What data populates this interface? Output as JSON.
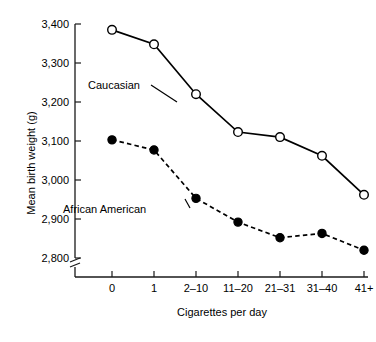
{
  "chart_data": {
    "type": "line",
    "title": "",
    "xlabel": "Cigarettes per day",
    "ylabel": "Mean birth weight (g)",
    "categories": [
      "0",
      "1",
      "2–10",
      "11–20",
      "21–31",
      "31–40",
      "41+"
    ],
    "ylim": [
      2800,
      3400
    ],
    "yticks": [
      "2,800",
      "2,900",
      "3,000",
      "3,100",
      "3,200",
      "3,300",
      "3,400"
    ],
    "ytick_values": [
      2800,
      2900,
      3000,
      3100,
      3200,
      3300,
      3400
    ],
    "axis_break": true,
    "grid": false,
    "legend_position": "inline-annotations",
    "series": [
      {
        "name": "Caucasian",
        "marker": "open-circle",
        "line_style": "solid",
        "values": [
          3385,
          3348,
          3220,
          3123,
          3110,
          3062,
          2962
        ]
      },
      {
        "name": "African American",
        "marker": "filled-circle",
        "line_style": "dashed",
        "values": [
          3103,
          3077,
          2953,
          2892,
          2852,
          2863,
          2820
        ]
      }
    ]
  },
  "annotations": {
    "caucasian_label": "Caucasian",
    "african_american_label": "African American"
  },
  "colors": {
    "line": "#000000",
    "axis": "#1a1a1a",
    "background": "#ffffff"
  },
  "footer": {
    "partial_caption": ""
  }
}
